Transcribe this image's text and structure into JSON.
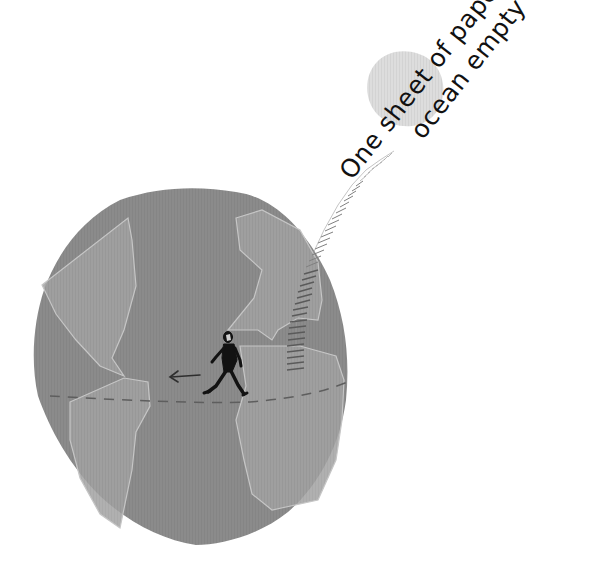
{
  "illustration": {
    "caption": {
      "line1": "One sheet of paper once",
      "line2": "ocean empty"
    },
    "colors": {
      "background": "#ffffff",
      "planet": "#8a8a8a",
      "continents": "#a3a3a3",
      "continent_edges": "#c4c4c4",
      "moon": "#dcdcdc",
      "figure": "#111111",
      "stitch": "#6e6e6e",
      "text": "#111111"
    },
    "elements": [
      "planet",
      "moon",
      "stitched-thread",
      "walking-man",
      "direction-arrow",
      "equator-dashed-line",
      "caption"
    ]
  }
}
